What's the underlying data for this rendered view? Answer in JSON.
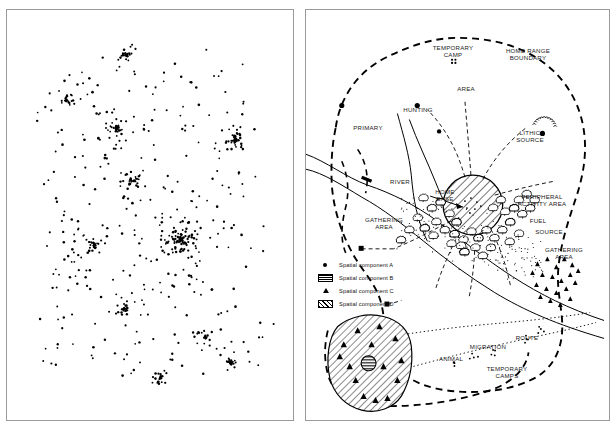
{
  "figure": {
    "panels": [
      {
        "id": "left",
        "name": "dot-density-site-distribution",
        "description": "Dot density scatter map of archaeological site locations with several dense clusters"
      },
      {
        "id": "right",
        "name": "interpretive-settlement-model",
        "description": "Schematic interpretive model of a hunter-gatherer home range with activity areas"
      }
    ]
  },
  "right_panel": {
    "labels": {
      "temporary_camp": "TEMPORARY\nCAMP",
      "home_range_boundary": "HOME RANGE\nBOUNDARY",
      "area": "AREA",
      "hunting": "HUNTING",
      "primary": "PRIMARY",
      "lithic_source": "LITHIC\nSOURCE",
      "river": "RIVER",
      "home_base": "HOME\nBASE",
      "peripheral_activity_area": "PERIPHERAL\nACTIVITY AREA",
      "fuel": "FUEL",
      "source": "SOURCE",
      "gathering_area_left": "GATHERING\nAREA",
      "gathering_area_right": "GATHERING\nAREA",
      "route": "ROUTE",
      "migration": "MIGRATION",
      "animal": "ANIMAL",
      "temporary_camps": "TEMPORARY\nCAMPS"
    },
    "legend": {
      "items": [
        {
          "symbol": "filled-circle",
          "label": "Spatial component A"
        },
        {
          "symbol": "striped-rect",
          "label": "Spatial component B"
        },
        {
          "symbol": "filled-triangle",
          "label": "Spatial component C"
        },
        {
          "symbol": "hatched-rect",
          "label": "Spatial component D"
        }
      ]
    }
  },
  "chart_data": {
    "type": "scatter",
    "title": "",
    "xlabel": "",
    "ylabel": "",
    "grid": false,
    "legend_position": "none",
    "xlim": [
      0,
      288
    ],
    "ylim": [
      0,
      412
    ],
    "series": [
      {
        "name": "Site locations (dot density)",
        "marker": "small-dot",
        "color": "#000000",
        "clusters": [
          {
            "cx": 60,
            "cy": 90,
            "n": 22,
            "spread": 10
          },
          {
            "cx": 120,
            "cy": 45,
            "n": 26,
            "spread": 10
          },
          {
            "cx": 110,
            "cy": 120,
            "n": 34,
            "spread": 12
          },
          {
            "cx": 126,
            "cy": 170,
            "n": 30,
            "spread": 11
          },
          {
            "cx": 230,
            "cy": 130,
            "n": 40,
            "spread": 10
          },
          {
            "cx": 175,
            "cy": 230,
            "n": 95,
            "spread": 20
          },
          {
            "cx": 88,
            "cy": 235,
            "n": 26,
            "spread": 10
          },
          {
            "cx": 118,
            "cy": 300,
            "n": 26,
            "spread": 10
          },
          {
            "cx": 225,
            "cy": 355,
            "n": 24,
            "spread": 9
          },
          {
            "cx": 155,
            "cy": 370,
            "n": 20,
            "spread": 11
          },
          {
            "cx": 200,
            "cy": 330,
            "n": 22,
            "spread": 16
          }
        ],
        "background_points": 330
      }
    ]
  },
  "colors": {
    "ink": "#000000",
    "frame": "#9a9a9a",
    "paper": "#ffffff"
  }
}
